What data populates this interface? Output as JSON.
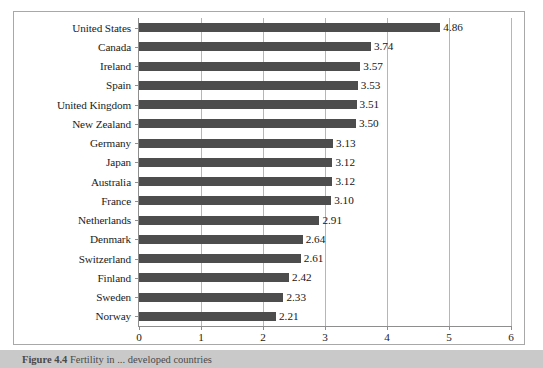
{
  "chart_data": {
    "type": "bar",
    "orientation": "horizontal",
    "title": "",
    "xlabel": "",
    "ylabel": "",
    "xlim": [
      0,
      6
    ],
    "xticks": [
      "0",
      "1",
      "2",
      "3",
      "4",
      "5",
      "6"
    ],
    "grid": true,
    "legend": false,
    "bar_color": "#4d4d4d",
    "categories": [
      "United States",
      "Canada",
      "Ireland",
      "Spain",
      "United Kingdom",
      "New Zealand",
      "Germany",
      "Japan",
      "Australia",
      "France",
      "Netherlands",
      "Denmark",
      "Switzerland",
      "Finland",
      "Sweden",
      "Norway"
    ],
    "values": [
      4.86,
      3.74,
      3.57,
      3.53,
      3.51,
      3.5,
      3.13,
      3.12,
      3.12,
      3.1,
      2.91,
      2.64,
      2.61,
      2.42,
      2.33,
      2.21
    ],
    "data_labels": [
      "4.86",
      "3.74",
      "3.57",
      "3.53",
      "3.51",
      "3.50",
      "3.13",
      "3.12",
      "3.12",
      "3.10",
      "2.91",
      "2.64",
      "2.61",
      "2.42",
      "2.33",
      "2.21"
    ]
  },
  "caption": {
    "number": "Figure 4.4",
    "text": "Fertility in ... developed countries"
  }
}
